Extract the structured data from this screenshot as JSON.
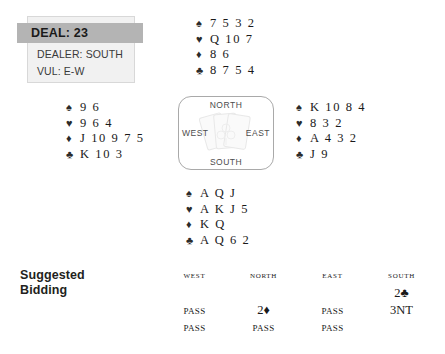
{
  "deal_info": {
    "deal_label": "DEAL:  23",
    "dealer": "DEALER: SOUTH",
    "vulnerability": "VUL: E-W"
  },
  "compass": {
    "north": "NORTH",
    "south": "SOUTH",
    "east": "EAST",
    "west": "WEST"
  },
  "suit_symbols": {
    "spade": "♠",
    "heart": "♥",
    "diamond": "♦",
    "club": "♣"
  },
  "hands": {
    "north": {
      "spades": "7 5 3 2",
      "hearts": "Q 10 7",
      "diamonds": "8 6",
      "clubs": "8 7 5 4"
    },
    "west": {
      "spades": "9 6",
      "hearts": "9 6 4",
      "diamonds": "J 10 9 7 5",
      "clubs": "K 10 3"
    },
    "east": {
      "spades": "K 10 8 4",
      "hearts": "8 3 2",
      "diamonds": "A 4 3 2",
      "clubs": "J 9"
    },
    "south": {
      "spades": "A Q J",
      "hearts": "A K J 5",
      "diamonds": "K Q",
      "clubs": "A Q 6 2"
    }
  },
  "bidding": {
    "title_line1": "Suggested",
    "title_line2": "Bidding",
    "columns": [
      "WEST",
      "NORTH",
      "EAST",
      "SOUTH"
    ],
    "rows": [
      [
        "",
        "",
        "",
        "2♣"
      ],
      [
        "Pass",
        "2♦",
        "Pass",
        "3NT"
      ],
      [
        "Pass",
        "Pass",
        "Pass",
        ""
      ]
    ]
  },
  "colors": {
    "deal_bar": "#b4b4b4",
    "deal_panel": "#f1f1f1",
    "text": "#231f20",
    "compass_border": "#a9a9a9"
  }
}
